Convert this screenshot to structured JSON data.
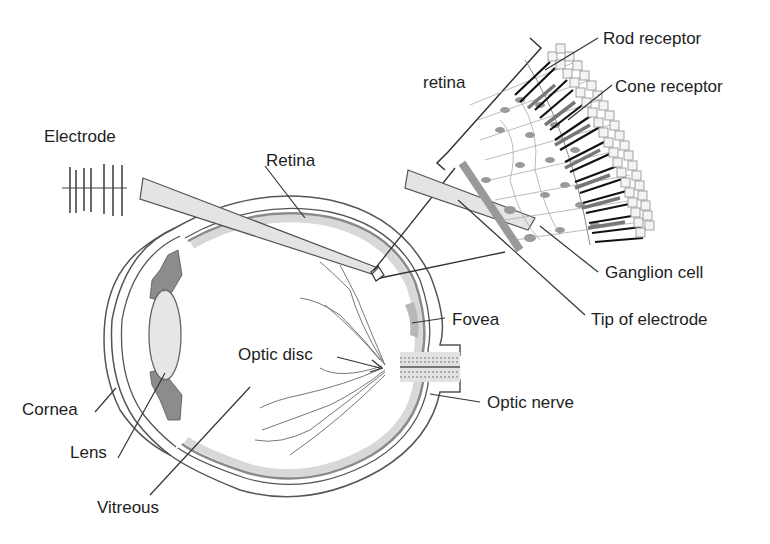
{
  "diagram": {
    "type": "anatomical-diagram",
    "labels": {
      "electrode": "Electrode",
      "retina_main": "Retina",
      "retina_inset": "retina",
      "rod_receptor": "Rod receptor",
      "cone_receptor": "Cone receptor",
      "ganglion_cell": "Ganglion cell",
      "tip_of_electrode": "Tip of electrode",
      "fovea": "Fovea",
      "optic_disc": "Optic disc",
      "optic_nerve": "Optic nerve",
      "cornea": "Cornea",
      "lens": "Lens",
      "vitreous": "Vitreous"
    },
    "colors": {
      "line": "#3a3a3a",
      "dark_gray": "#7a7a7a",
      "mid_gray": "#a8a8a8",
      "light_gray": "#d8d8d8",
      "fill_light": "#ececec",
      "background": "#ffffff"
    }
  }
}
